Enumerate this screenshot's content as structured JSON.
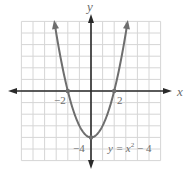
{
  "chart_data": {
    "type": "line",
    "title": "",
    "equation_label": "y = x² − 4",
    "function": "y = x^2 - 4",
    "xlabel": "x",
    "ylabel": "y",
    "xlim": [
      -6,
      6
    ],
    "ylim": [
      -6,
      6
    ],
    "grid": true,
    "tick_labels": {
      "x": [
        {
          "value": -2,
          "label": "−2"
        },
        {
          "value": 2,
          "label": "2"
        }
      ],
      "y": [
        {
          "value": -4,
          "label": "−4"
        }
      ]
    },
    "marked_points": [
      {
        "x": -2,
        "y": 0
      },
      {
        "x": 2,
        "y": 0
      },
      {
        "x": 0,
        "y": -4
      }
    ],
    "series": [
      {
        "name": "y = x² − 4",
        "x": [
          -3.1,
          -3,
          -2.5,
          -2,
          -1.5,
          -1,
          -0.5,
          0,
          0.5,
          1,
          1.5,
          2,
          2.5,
          3,
          3.1
        ],
        "y": [
          5.61,
          5,
          2.25,
          0,
          -1.75,
          -3,
          -3.75,
          -4,
          -3.75,
          -3,
          -1.75,
          0,
          2.25,
          5,
          5.61
        ]
      }
    ],
    "colors": {
      "curve": "#6e6e6e",
      "axes": "#2a2a2a",
      "grid": "#d6d6d6",
      "text": "#6a6a6a"
    }
  },
  "labels": {
    "x_axis": "x",
    "y_axis": "y",
    "x_neg2": "−2",
    "x_pos2": "2",
    "y_neg4": "−4",
    "eq_prefix": "y = x",
    "eq_exp": "2",
    "eq_suffix": " − 4"
  }
}
